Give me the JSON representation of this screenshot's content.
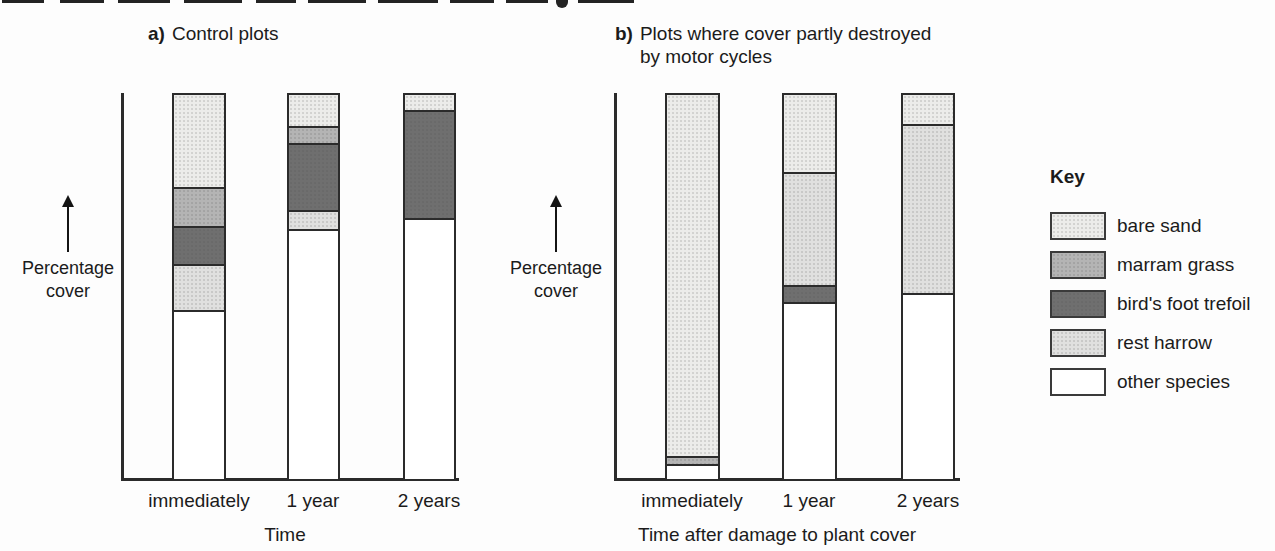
{
  "colors": {
    "bare_sand": "#ececea",
    "marram_grass": "#b4b4b4",
    "birds_foot_trefoil": "#6f6f6f",
    "rest_harrow": "#e0e0df",
    "other_species": "#ffffff",
    "outline": "#2b2b2b",
    "text": "#1b1b1b"
  },
  "legend": {
    "title": "Key",
    "items": [
      {
        "label": "bare sand",
        "color": "#ececea",
        "textured": true
      },
      {
        "label": "marram grass",
        "color": "#b4b4b4",
        "textured": true
      },
      {
        "label": "bird's foot trefoil",
        "color": "#6f6f6f",
        "textured": true
      },
      {
        "label": "rest harrow",
        "color": "#e0e0df",
        "textured": true
      },
      {
        "label": "other species",
        "color": "#ffffff",
        "textured": false
      }
    ]
  },
  "chart_data": [
    {
      "type": "bar",
      "stacked": true,
      "units": "percent of cover",
      "title_prefix": "a)",
      "title": "Control plots",
      "title_lines": [
        "Control plots"
      ],
      "ylabel_lines": [
        "Percentage",
        "cover"
      ],
      "xlabel": "Time",
      "ylim": [
        0,
        100
      ],
      "y_ticks_shown": false,
      "grid": false,
      "categories": [
        "immediately",
        "1 year",
        "2 years"
      ],
      "bars": [
        {
          "category": "immediately",
          "segments_top_to_bottom": [
            {
              "species": "bare sand",
              "percent": 24
            },
            {
              "species": "marram grass",
              "percent": 10
            },
            {
              "species": "bird's foot trefoil",
              "percent": 10
            },
            {
              "species": "rest harrow",
              "percent": 12
            },
            {
              "species": "other species",
              "percent": 44
            }
          ]
        },
        {
          "category": "1 year",
          "segments_top_to_bottom": [
            {
              "species": "bare sand",
              "percent": 8
            },
            {
              "species": "marram grass",
              "percent": 4.5
            },
            {
              "species": "bird's foot trefoil",
              "percent": 17.5
            },
            {
              "species": "rest harrow",
              "percent": 5
            },
            {
              "species": "other species",
              "percent": 65
            }
          ]
        },
        {
          "category": "2 years",
          "segments_top_to_bottom": [
            {
              "species": "bare sand",
              "percent": 4
            },
            {
              "species": "bird's foot trefoil",
              "percent": 28
            },
            {
              "species": "other species",
              "percent": 68
            }
          ]
        }
      ]
    },
    {
      "type": "bar",
      "stacked": true,
      "units": "percent of cover",
      "title_prefix": "b)",
      "title": "Plots where cover partly destroyed by motor cycles",
      "title_lines": [
        "Plots where cover partly destroyed",
        "by motor cycles"
      ],
      "ylabel_lines": [
        "Percentage",
        "cover"
      ],
      "xlabel": "Time after damage to plant cover",
      "ylim": [
        0,
        100
      ],
      "y_ticks_shown": false,
      "grid": false,
      "categories": [
        "immediately",
        "1 year",
        "2 years"
      ],
      "bars": [
        {
          "category": "immediately",
          "segments_top_to_bottom": [
            {
              "species": "bare sand",
              "percent": 94
            },
            {
              "species": "marram grass",
              "percent": 2
            },
            {
              "species": "other species",
              "percent": 4
            }
          ]
        },
        {
          "category": "1 year",
          "segments_top_to_bottom": [
            {
              "species": "bare sand",
              "percent": 20
            },
            {
              "species": "rest harrow",
              "percent": 29.5
            },
            {
              "species": "bird's foot trefoil",
              "percent": 4.5
            },
            {
              "species": "other species",
              "percent": 46
            }
          ]
        },
        {
          "category": "2 years",
          "segments_top_to_bottom": [
            {
              "species": "bare sand",
              "percent": 7.5
            },
            {
              "species": "rest harrow",
              "percent": 44
            },
            {
              "species": "other species",
              "percent": 48.5
            }
          ]
        }
      ]
    }
  ]
}
